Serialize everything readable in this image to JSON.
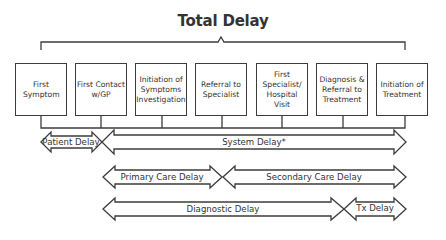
{
  "title": "Total Delay",
  "steps": [
    {
      "label": "First Symptom"
    },
    {
      "label": "First Contact w/GP"
    },
    {
      "label": "Initiation of Symptoms Investigation"
    },
    {
      "label": "Referral to Specialist"
    },
    {
      "label": "First Specialist/ Hospital Visit"
    },
    {
      "label": "Diagnosis & Referral to Treatment"
    },
    {
      "label": "Initiation of Treatment"
    }
  ],
  "delays": [
    {
      "label": "Patient Delay",
      "from_step": 1,
      "to_step": 2
    },
    {
      "label": "System Delay*",
      "from_step": 2,
      "to_step": 7
    },
    {
      "label": "Primary Care Delay",
      "from_step": 2,
      "to_step": 4
    },
    {
      "label": "Secondary Care Delay",
      "from_step": 4,
      "to_step": 7
    },
    {
      "label": "Diagnostic Delay",
      "from_step": 2,
      "to_step": 6
    },
    {
      "label": "Tx Delay",
      "from_step": 6,
      "to_step": 7
    }
  ],
  "colors": {
    "stroke": "#3c3c3c",
    "text": "#333333",
    "background": "#ffffff"
  }
}
